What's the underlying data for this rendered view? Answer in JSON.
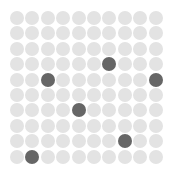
{
  "grid": {
    "rows": 10,
    "cols": 10,
    "colors": {
      "inactive": "#e3e3e3",
      "active": "#666666"
    },
    "active_cells": [
      {
        "row": 3,
        "col": 6
      },
      {
        "row": 4,
        "col": 2
      },
      {
        "row": 4,
        "col": 9
      },
      {
        "row": 6,
        "col": 4
      },
      {
        "row": 8,
        "col": 7
      },
      {
        "row": 9,
        "col": 1
      }
    ]
  }
}
